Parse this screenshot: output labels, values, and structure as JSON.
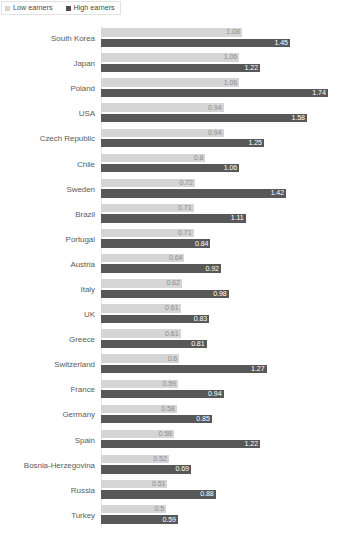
{
  "legend": {
    "position": "top-left",
    "items": [
      {
        "label": "Low earners",
        "color": "#d5d5d5",
        "key": "low"
      },
      {
        "label": "High earners",
        "color": "#4f4f4f",
        "key": "high"
      }
    ]
  },
  "colors": {
    "low_bar": "#d5d5d5",
    "high_bar": "#585858",
    "low_label_text": "#8e8e8e",
    "high_label_text": "#ffffff",
    "category_text": "#5c5c5c",
    "axis_line": "#e6e6e6",
    "background": "#ffffff"
  },
  "chart_data": {
    "type": "bar",
    "orientation": "horizontal",
    "grouped": true,
    "title": "",
    "subtitle": "",
    "xlabel": "",
    "ylabel": "",
    "grid": false,
    "legend_position": "top-left",
    "xlim": [
      0,
      1.78
    ],
    "categories": [
      "South Korea",
      "Japan",
      "Poland",
      "USA",
      "Czech Republic",
      "Chile",
      "Sweden",
      "Brazil",
      "Portugal",
      "Austria",
      "Italy",
      "UK",
      "Greece",
      "Switzerland",
      "France",
      "Germany",
      "Spain",
      "Bosnia-Herzegovina",
      "Russia",
      "Turkey"
    ],
    "series": [
      {
        "name": "Low earners",
        "color": "#d5d5d5",
        "values": [
          1.08,
          1.06,
          1.06,
          0.94,
          0.94,
          0.8,
          0.72,
          0.71,
          0.71,
          0.64,
          0.62,
          0.61,
          0.61,
          0.6,
          0.59,
          0.58,
          0.56,
          0.52,
          0.51,
          0.5
        ],
        "labels": [
          "1.08",
          "1.06",
          "1.06",
          "0.94",
          "0.94",
          "0.8",
          "0.72",
          "0.71",
          "0.71",
          "0.64",
          "0.62",
          "0.61",
          "0.61",
          "0.6",
          "0.59",
          "0.58",
          "0.56",
          "0.52",
          "0.51",
          "0.5"
        ]
      },
      {
        "name": "High earners",
        "color": "#585858",
        "values": [
          1.45,
          1.22,
          1.74,
          1.58,
          1.25,
          1.06,
          1.42,
          1.11,
          0.84,
          0.92,
          0.98,
          0.83,
          0.81,
          1.27,
          0.94,
          0.85,
          1.22,
          0.69,
          0.88,
          0.59
        ],
        "labels": [
          "1.45",
          "1.22",
          "1.74",
          "1.58",
          "1.25",
          "1.06",
          "1.42",
          "1.11",
          "0.84",
          "0.92",
          "0.98",
          "0.83",
          "0.81",
          "1.27",
          "0.94",
          "0.85",
          "1.22",
          "0.69",
          "0.88",
          "0.59"
        ]
      }
    ]
  },
  "footnote": {
    "text": ""
  }
}
